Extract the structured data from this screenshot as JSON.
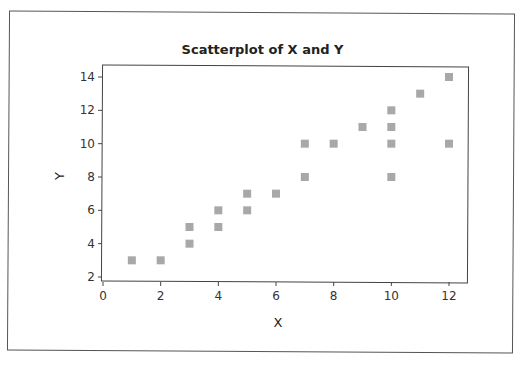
{
  "chart_data": {
    "type": "scatter",
    "title": "Scatterplot of X and Y",
    "xlabel": "X",
    "ylabel": "Y",
    "xlim": [
      0,
      12.6
    ],
    "ylim": [
      1.8,
      14.6
    ],
    "xticks": [
      0,
      2,
      4,
      6,
      8,
      10,
      12
    ],
    "yticks": [
      2,
      4,
      6,
      8,
      10,
      12,
      14
    ],
    "grid": false,
    "legend": null,
    "marker": "square",
    "marker_color": "#a8a8a8",
    "series": [
      {
        "name": "Y vs X",
        "points": [
          {
            "x": 1,
            "y": 3
          },
          {
            "x": 2,
            "y": 3
          },
          {
            "x": 3,
            "y": 4
          },
          {
            "x": 3,
            "y": 5
          },
          {
            "x": 4,
            "y": 5
          },
          {
            "x": 4,
            "y": 6
          },
          {
            "x": 5,
            "y": 6
          },
          {
            "x": 5,
            "y": 7
          },
          {
            "x": 6,
            "y": 7
          },
          {
            "x": 7,
            "y": 8
          },
          {
            "x": 7,
            "y": 10
          },
          {
            "x": 8,
            "y": 10
          },
          {
            "x": 9,
            "y": 11
          },
          {
            "x": 10,
            "y": 8
          },
          {
            "x": 10,
            "y": 10
          },
          {
            "x": 10,
            "y": 11
          },
          {
            "x": 10,
            "y": 12
          },
          {
            "x": 11,
            "y": 13
          },
          {
            "x": 12,
            "y": 10
          },
          {
            "x": 12,
            "y": 14
          }
        ]
      }
    ]
  }
}
